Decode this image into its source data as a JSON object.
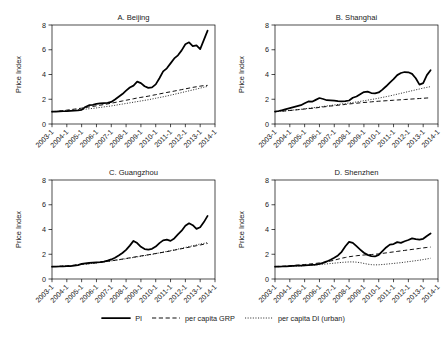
{
  "figure": {
    "width": 446,
    "height": 340,
    "background": "#ffffff",
    "ink": "#000000"
  },
  "legend": {
    "position": "bottom-center",
    "items": [
      {
        "label": "PI",
        "style": "solid-thick",
        "name": "legend-item-pi"
      },
      {
        "label": "per capita GRP",
        "style": "dashed",
        "name": "legend-item-grp"
      },
      {
        "label": "per capita DI (urban)",
        "style": "dotted",
        "name": "legend-item-di"
      }
    ]
  },
  "axes": {
    "ylabel": "Price Index",
    "yticks": [
      "0",
      "2",
      "4",
      "6",
      "8"
    ],
    "ylim": [
      0,
      8
    ],
    "xticks": [
      "2003-1",
      "2004-1",
      "2005-1",
      "2006-1",
      "2007-1",
      "2008-1",
      "2009-1",
      "2010-1",
      "2011-1",
      "2012-1",
      "2013-1",
      "2014-1"
    ],
    "xlim": [
      2003,
      2014
    ],
    "grid": false
  },
  "chart_data": {
    "type": "line",
    "title": "",
    "xlabel": "",
    "ylabel": "Price Index",
    "ylim": [
      0,
      8
    ],
    "xlim": [
      2003,
      2014
    ],
    "grid": false,
    "legend_position": "bottom-center",
    "x": [
      2003.0,
      2003.25,
      2003.5,
      2003.75,
      2004.0,
      2004.25,
      2004.5,
      2004.75,
      2005.0,
      2005.25,
      2005.5,
      2005.75,
      2006.0,
      2006.25,
      2006.5,
      2006.75,
      2007.0,
      2007.25,
      2007.5,
      2007.75,
      2008.0,
      2008.25,
      2008.5,
      2008.75,
      2009.0,
      2009.25,
      2009.5,
      2009.75,
      2010.0,
      2010.25,
      2010.5,
      2010.75,
      2011.0,
      2011.25,
      2011.5,
      2011.75,
      2012.0,
      2012.25,
      2012.5,
      2012.75,
      2013.0,
      2013.25,
      2013.5
    ],
    "panels": [
      {
        "key": "beijing",
        "title": "A. Beijing",
        "series": [
          {
            "name": "PI",
            "style": "solid-thick",
            "values": [
              1.0,
              1.0,
              1.02,
              1.03,
              1.04,
              1.06,
              1.08,
              1.1,
              1.14,
              1.38,
              1.52,
              1.55,
              1.62,
              1.66,
              1.68,
              1.7,
              1.78,
              1.98,
              2.2,
              2.42,
              2.7,
              2.95,
              3.1,
              3.42,
              3.3,
              3.05,
              2.92,
              2.96,
              3.2,
              3.7,
              4.25,
              4.5,
              4.9,
              5.3,
              5.55,
              5.95,
              6.45,
              6.6,
              6.3,
              6.35,
              6.05,
              6.8,
              7.55
            ]
          },
          {
            "name": "per capita GRP",
            "style": "dashed",
            "values": [
              1.0,
              1.02,
              1.05,
              1.08,
              1.12,
              1.16,
              1.2,
              1.24,
              1.28,
              1.33,
              1.38,
              1.42,
              1.47,
              1.52,
              1.57,
              1.62,
              1.68,
              1.74,
              1.8,
              1.86,
              1.92,
              1.98,
              2.04,
              2.1,
              2.15,
              2.2,
              2.25,
              2.31,
              2.37,
              2.43,
              2.49,
              2.55,
              2.6,
              2.66,
              2.72,
              2.78,
              2.84,
              2.9,
              2.96,
              3.01,
              3.06,
              3.1,
              3.12
            ]
          },
          {
            "name": "per capita DI (urban)",
            "style": "dotted",
            "values": [
              1.0,
              1.01,
              1.03,
              1.05,
              1.07,
              1.09,
              1.11,
              1.14,
              1.17,
              1.2,
              1.23,
              1.26,
              1.3,
              1.34,
              1.38,
              1.42,
              1.46,
              1.51,
              1.56,
              1.61,
              1.66,
              1.71,
              1.76,
              1.81,
              1.86,
              1.91,
              1.96,
              2.02,
              2.08,
              2.14,
              2.2,
              2.26,
              2.33,
              2.4,
              2.47,
              2.54,
              2.61,
              2.68,
              2.75,
              2.82,
              2.9,
              2.97,
              3.04
            ]
          }
        ]
      },
      {
        "key": "shanghai",
        "title": "B. Shanghai",
        "series": [
          {
            "name": "PI",
            "style": "solid-thick",
            "values": [
              1.0,
              1.05,
              1.12,
              1.2,
              1.28,
              1.36,
              1.44,
              1.52,
              1.68,
              1.82,
              1.8,
              1.95,
              2.1,
              2.02,
              1.92,
              1.9,
              1.88,
              1.85,
              1.83,
              1.84,
              1.9,
              2.12,
              2.22,
              2.4,
              2.58,
              2.62,
              2.5,
              2.48,
              2.55,
              2.78,
              3.05,
              3.35,
              3.62,
              3.95,
              4.12,
              4.2,
              4.18,
              4.05,
              3.7,
              3.18,
              3.3,
              3.95,
              4.35
            ]
          },
          {
            "name": "per capita GRP",
            "style": "dashed",
            "values": [
              1.0,
              1.02,
              1.04,
              1.06,
              1.09,
              1.12,
              1.15,
              1.18,
              1.21,
              1.24,
              1.27,
              1.3,
              1.34,
              1.38,
              1.41,
              1.45,
              1.48,
              1.52,
              1.55,
              1.58,
              1.62,
              1.65,
              1.68,
              1.71,
              1.74,
              1.76,
              1.79,
              1.82,
              1.84,
              1.86,
              1.88,
              1.9,
              1.92,
              1.94,
              1.96,
              1.98,
              2.0,
              2.02,
              2.04,
              2.06,
              2.08,
              2.1,
              2.12
            ]
          },
          {
            "name": "per capita DI (urban)",
            "style": "dotted",
            "values": [
              1.0,
              1.02,
              1.04,
              1.07,
              1.1,
              1.13,
              1.16,
              1.19,
              1.23,
              1.27,
              1.3,
              1.34,
              1.38,
              1.42,
              1.46,
              1.5,
              1.54,
              1.58,
              1.62,
              1.66,
              1.7,
              1.74,
              1.78,
              1.83,
              1.88,
              1.93,
              1.98,
              2.03,
              2.09,
              2.15,
              2.21,
              2.27,
              2.34,
              2.41,
              2.48,
              2.55,
              2.62,
              2.69,
              2.76,
              2.83,
              2.9,
              2.96,
              3.02
            ]
          }
        ]
      },
      {
        "key": "guangzhou",
        "title": "C. Guangzhou",
        "series": [
          {
            "name": "PI",
            "style": "solid-thick",
            "values": [
              1.0,
              1.0,
              1.01,
              1.02,
              1.03,
              1.05,
              1.08,
              1.12,
              1.22,
              1.26,
              1.3,
              1.32,
              1.34,
              1.36,
              1.4,
              1.48,
              1.58,
              1.72,
              1.9,
              2.1,
              2.35,
              2.7,
              3.08,
              2.9,
              2.6,
              2.42,
              2.38,
              2.44,
              2.62,
              2.9,
              3.12,
              3.18,
              3.08,
              3.28,
              3.6,
              3.9,
              4.3,
              4.5,
              4.35,
              4.05,
              4.18,
              4.6,
              5.1
            ]
          },
          {
            "name": "per capita GRP",
            "style": "dashed",
            "values": [
              1.0,
              1.01,
              1.03,
              1.05,
              1.07,
              1.09,
              1.12,
              1.15,
              1.18,
              1.21,
              1.24,
              1.28,
              1.31,
              1.35,
              1.39,
              1.43,
              1.47,
              1.52,
              1.56,
              1.61,
              1.66,
              1.71,
              1.76,
              1.81,
              1.86,
              1.91,
              1.96,
              2.01,
              2.06,
              2.11,
              2.16,
              2.21,
              2.27,
              2.33,
              2.39,
              2.45,
              2.51,
              2.57,
              2.63,
              2.69,
              2.75,
              2.81,
              2.87
            ]
          },
          {
            "name": "per capita DI (urban)",
            "style": "dotted",
            "values": [
              1.0,
              1.01,
              1.03,
              1.04,
              1.06,
              1.08,
              1.11,
              1.14,
              1.17,
              1.2,
              1.23,
              1.27,
              1.3,
              1.34,
              1.38,
              1.42,
              1.46,
              1.5,
              1.55,
              1.59,
              1.64,
              1.69,
              1.74,
              1.79,
              1.84,
              1.89,
              1.94,
              1.99,
              2.05,
              2.11,
              2.17,
              2.23,
              2.29,
              2.35,
              2.42,
              2.48,
              2.55,
              2.62,
              2.69,
              2.76,
              2.83,
              2.88,
              2.94
            ]
          }
        ]
      },
      {
        "key": "shenzhen",
        "title": "D. Shenzhen",
        "series": [
          {
            "name": "PI",
            "style": "solid-thick",
            "values": [
              1.0,
              1.0,
              1.01,
              1.02,
              1.04,
              1.06,
              1.08,
              1.08,
              1.1,
              1.12,
              1.14,
              1.16,
              1.22,
              1.3,
              1.42,
              1.56,
              1.72,
              1.9,
              2.2,
              2.65,
              3.0,
              2.92,
              2.65,
              2.38,
              2.12,
              1.95,
              1.85,
              1.82,
              1.95,
              2.25,
              2.55,
              2.78,
              2.82,
              2.98,
              2.92,
              3.05,
              3.15,
              3.28,
              3.22,
              3.18,
              3.25,
              3.48,
              3.68
            ]
          },
          {
            "name": "per capita GRP",
            "style": "dashed",
            "values": [
              1.0,
              1.02,
              1.04,
              1.06,
              1.08,
              1.1,
              1.12,
              1.14,
              1.17,
              1.2,
              1.23,
              1.26,
              1.3,
              1.34,
              1.39,
              1.45,
              1.52,
              1.6,
              1.68,
              1.74,
              1.8,
              1.84,
              1.88,
              1.91,
              1.94,
              1.96,
              1.98,
              2.0,
              2.03,
              2.07,
              2.11,
              2.15,
              2.19,
              2.23,
              2.27,
              2.31,
              2.35,
              2.39,
              2.43,
              2.47,
              2.51,
              2.55,
              2.58
            ]
          },
          {
            "name": "per capita DI (urban)",
            "style": "dotted",
            "values": [
              1.0,
              1.0,
              1.01,
              1.02,
              1.03,
              1.04,
              1.05,
              1.06,
              1.08,
              1.1,
              1.12,
              1.14,
              1.16,
              1.19,
              1.22,
              1.25,
              1.28,
              1.31,
              1.34,
              1.36,
              1.38,
              1.38,
              1.36,
              1.32,
              1.26,
              1.2,
              1.16,
              1.14,
              1.15,
              1.17,
              1.2,
              1.23,
              1.26,
              1.29,
              1.32,
              1.36,
              1.4,
              1.44,
              1.48,
              1.52,
              1.57,
              1.62,
              1.68
            ]
          }
        ]
      }
    ]
  }
}
